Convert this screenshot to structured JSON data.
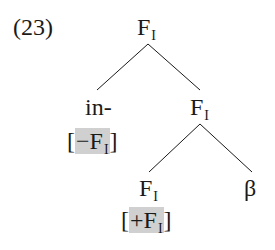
{
  "example_number": "(23)",
  "tree": {
    "root": {
      "label": "F",
      "sub": "I"
    },
    "left": {
      "label": "in-",
      "feature": {
        "open": "[",
        "sign": "−",
        "label": "F",
        "sub": "I",
        "close": "]"
      }
    },
    "right": {
      "label": "F",
      "sub": "I",
      "children": [
        {
          "label": "F",
          "sub": "I",
          "feature": {
            "open": "[",
            "sign": "+",
            "label": "F",
            "sub": "I",
            "close": "]"
          }
        },
        {
          "label": "β"
        }
      ]
    }
  },
  "colors": {
    "highlight": "#d0d0d0",
    "ink": "#1a1a1a"
  }
}
